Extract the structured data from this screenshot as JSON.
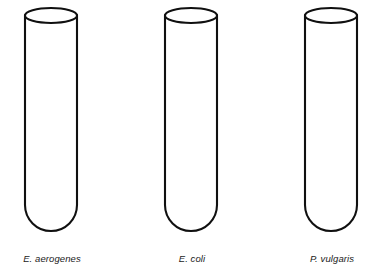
{
  "figure": {
    "kind": "line-diagram",
    "background_color": "#ffffff",
    "stroke_color": "#101010",
    "fill_color": "#ffffff",
    "canvas": {
      "width": 381,
      "height": 271
    }
  },
  "tubes": [
    {
      "id": "tube-1",
      "label": "E. aerogenes",
      "organism_genus_abbrev": "E.",
      "organism_species": "aerogenes",
      "left": 25,
      "top": 15,
      "width": 54,
      "height": 228,
      "rim_height": 15,
      "label_left": 25,
      "label_top": 253,
      "label_width": 54
    },
    {
      "id": "tube-2",
      "label": "E. coli",
      "organism_genus_abbrev": "E.",
      "organism_species": "coli",
      "left": 165,
      "top": 15,
      "width": 54,
      "height": 228,
      "rim_height": 15,
      "label_left": 165,
      "label_top": 253,
      "label_width": 54
    },
    {
      "id": "tube-3",
      "label": "P. vulgaris",
      "organism_genus_abbrev": "P.",
      "organism_species": "vulgaris",
      "left": 305,
      "top": 15,
      "width": 54,
      "height": 228,
      "rim_height": 15,
      "label_left": 305,
      "label_top": 253,
      "label_width": 54
    }
  ]
}
